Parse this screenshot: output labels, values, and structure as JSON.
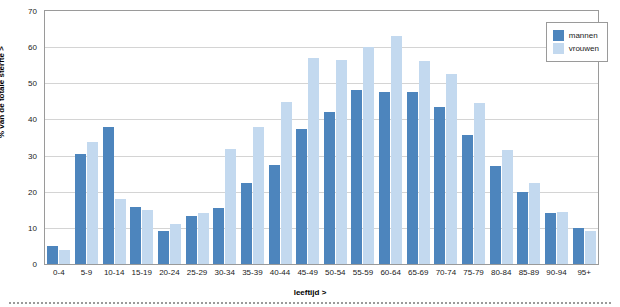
{
  "chart_data": {
    "type": "bar",
    "title": "",
    "xlabel": "leeftijd >",
    "ylabel": "% van de totale sterfte >",
    "ylim": [
      0,
      70
    ],
    "yticks": [
      0,
      10,
      20,
      30,
      40,
      50,
      60,
      70
    ],
    "grid": true,
    "legend_position": "top-right",
    "categories": [
      "0-4",
      "5-9",
      "10-14",
      "15-19",
      "20-24",
      "25-29",
      "30-34",
      "35-39",
      "40-44",
      "45-49",
      "50-54",
      "55-59",
      "60-64",
      "65-69",
      "70-74",
      "75-79",
      "80-84",
      "85-89",
      "90-94",
      "95+"
    ],
    "series": [
      {
        "name": "mannen",
        "color": "#4d85bd",
        "values": [
          5.0,
          30.5,
          38.0,
          15.8,
          9.2,
          13.2,
          15.5,
          22.3,
          27.5,
          37.3,
          42.0,
          48.2,
          47.5,
          47.5,
          43.5,
          35.8,
          27.0,
          20.0,
          14.0,
          10.0
        ]
      },
      {
        "name": "vrouwen",
        "color": "#c3d9ef",
        "values": [
          4.0,
          33.8,
          18.0,
          15.0,
          11.0,
          14.0,
          31.8,
          38.0,
          44.8,
          57.0,
          56.5,
          60.0,
          63.0,
          56.2,
          52.5,
          44.5,
          31.5,
          22.5,
          14.5,
          9.0
        ]
      }
    ]
  },
  "legend": {
    "items": [
      {
        "label": "mannen"
      },
      {
        "label": "vrouwen"
      }
    ]
  }
}
